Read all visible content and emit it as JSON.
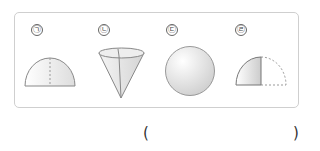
{
  "question": {
    "options": [
      {
        "label": "㉠",
        "shape": "half-sphere (hemisphere)"
      },
      {
        "label": "㉡",
        "shape": "cone"
      },
      {
        "label": "㉢",
        "shape": "sphere"
      },
      {
        "label": "㉣",
        "shape": "quarter-sphere with dashed outline of hemisphere"
      }
    ],
    "answer_open": "(",
    "answer_close": ")"
  }
}
